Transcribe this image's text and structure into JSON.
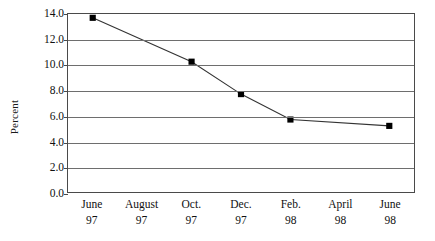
{
  "chart_data": {
    "type": "line",
    "title": "",
    "xlabel": "",
    "ylabel": "Percent",
    "ylim": [
      0.0,
      14.0
    ],
    "ytick_step": 2.0,
    "ytick_labels": [
      "14.0",
      "12.0",
      "10.0",
      "8.0",
      "6.0",
      "4.0",
      "2.0",
      "0.0"
    ],
    "ytick_values": [
      14.0,
      12.0,
      10.0,
      8.0,
      6.0,
      4.0,
      2.0,
      0.0
    ],
    "grid": true,
    "grid_axis": "y",
    "legend": false,
    "categories": [
      "June 97",
      "August 97",
      "Oct. 97",
      "Dec. 97",
      "Feb. 98",
      "April 98",
      "June 98"
    ],
    "category_periods": [
      "June",
      "August",
      "Oct.",
      "Dec.",
      "Feb.",
      "April",
      "June"
    ],
    "category_years": [
      "97",
      "97",
      "97",
      "97",
      "98",
      "98",
      "98"
    ],
    "values": [
      13.7,
      null,
      10.25,
      7.7,
      5.7,
      null,
      5.2
    ],
    "marker": "square",
    "marker_color": "#000000",
    "line_color": "#333333",
    "series": [
      {
        "name": "Percent",
        "points": [
          {
            "x": "June 97",
            "y": 13.7
          },
          {
            "x": "Oct. 97",
            "y": 10.25
          },
          {
            "x": "Dec. 97",
            "y": 7.7
          },
          {
            "x": "Feb. 98",
            "y": 5.7
          },
          {
            "x": "June 98",
            "y": 5.2
          }
        ]
      }
    ]
  },
  "style": {
    "axis_color": "#4a4a4a",
    "grid_color": "#6e6e6e",
    "text_color": "#111111",
    "background": "#ffffff"
  }
}
